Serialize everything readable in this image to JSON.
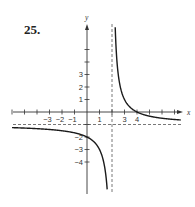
{
  "problem_number": "25.",
  "chart_data": {
    "type": "line",
    "title": "",
    "function": "f(x) = (4 - x) / (x - 2)",
    "xlabel": "x",
    "ylabel": "y",
    "xlim": [
      -6.5,
      7.5
    ],
    "ylim": [
      -6.5,
      7
    ],
    "grid": false,
    "x_ticks": [
      -6,
      -5,
      -4,
      -3,
      -2,
      -1,
      1,
      2,
      3,
      4,
      5,
      6,
      7
    ],
    "x_tick_labels": [
      {
        "value": -3,
        "label": "−3"
      },
      {
        "value": -2,
        "label": "−2"
      },
      {
        "value": -1,
        "label": "−1"
      },
      {
        "value": 1,
        "label": "1"
      },
      {
        "value": 3,
        "label": "3"
      },
      {
        "value": 4,
        "label": "4"
      }
    ],
    "y_ticks": [
      -4,
      -3,
      -2,
      -1,
      1,
      2,
      3,
      4,
      5
    ],
    "y_tick_labels": [
      {
        "value": 3,
        "label": "3"
      },
      {
        "value": 2,
        "label": "2"
      },
      {
        "value": 1,
        "label": "1"
      },
      {
        "value": -2,
        "label": "−2"
      },
      {
        "value": -3,
        "label": "−3"
      },
      {
        "value": -4,
        "label": "−4"
      }
    ],
    "asymptotes": {
      "vertical": 2,
      "horizontal": -1
    },
    "intercepts": {
      "x": 4,
      "y": -2
    },
    "series": [
      {
        "name": "left-branch",
        "x_range": [
          -6,
          1.85
        ]
      },
      {
        "name": "right-branch",
        "x_range": [
          2.15,
          7.5
        ]
      }
    ],
    "colors": {
      "curve": "#1a1a1a",
      "axis": "#333333",
      "asymptote": "#555555"
    }
  }
}
